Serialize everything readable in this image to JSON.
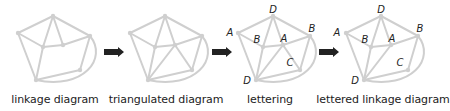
{
  "figure": {
    "stroke_color": "#cfcfcf",
    "arrow_color": "#222222",
    "panels": [
      {
        "id": "linkage",
        "caption": "linkage diagram",
        "offset_x": 0,
        "triangulated": false,
        "lettered": false
      },
      {
        "id": "triangulated",
        "caption": "triangulated diagram",
        "offset_x": 112,
        "triangulated": true,
        "lettered": false
      },
      {
        "id": "lettering",
        "caption": "lettering",
        "offset_x": 220,
        "triangulated": true,
        "lettered": true
      },
      {
        "id": "lettered-linkage",
        "caption": "lettered linkage diagram",
        "offset_x": 320,
        "triangulated": false,
        "lettered": true
      }
    ],
    "arrows_between_panels": 3,
    "vertex_letters": {
      "top": "D",
      "left": "A",
      "inner_left": "B",
      "inner_right": "A",
      "right": "B",
      "lower_right": "C",
      "bottom": "D"
    }
  },
  "captions": {
    "p1": "linkage diagram",
    "p2": "triangulated diagram",
    "p3": "lettering",
    "p4": "lettered linkage diagram"
  },
  "letters": {
    "p3": {
      "top": "D",
      "left": "A",
      "inner_left": "B",
      "inner_right": "A",
      "right": "B",
      "lower_right": "C",
      "bottom": "D"
    },
    "p4": {
      "top": "D",
      "left": "A",
      "inner_left": "B",
      "inner_right": "A",
      "right": "B",
      "lower_right": "C",
      "bottom": "D"
    }
  }
}
